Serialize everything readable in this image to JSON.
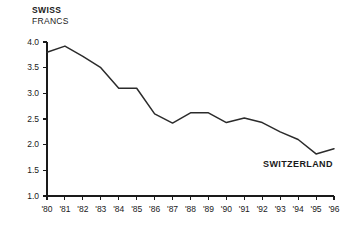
{
  "chart_data": {
    "type": "line",
    "title": "SWISS",
    "subtitle": "FRANCS",
    "series_annotation": "SWITZERLAND",
    "xlabel": "",
    "ylabel": "",
    "grid": false,
    "legend_position": "inline-right",
    "ylim": [
      1.0,
      4.0
    ],
    "ytick_labels": [
      "4.0",
      "3.5",
      "3.0",
      "2.5",
      "2.0",
      "1.5",
      "1.0"
    ],
    "ytick_values": [
      4.0,
      3.5,
      3.0,
      2.5,
      2.0,
      1.5,
      1.0
    ],
    "categories": [
      "'80",
      "'81",
      "'82",
      "'83",
      "'84",
      "'85",
      "'86",
      "'87",
      "'88",
      "'89",
      "'90",
      "'91",
      "'92",
      "'93",
      "'94",
      "'95",
      "'96"
    ],
    "x": [
      1980,
      1981,
      1982,
      1983,
      1984,
      1985,
      1986,
      1987,
      1988,
      1989,
      1990,
      1991,
      1992,
      1993,
      1994,
      1995,
      1996
    ],
    "series": [
      {
        "name": "SWITZERLAND",
        "values": [
          3.8,
          3.92,
          3.72,
          3.5,
          3.1,
          3.1,
          2.6,
          2.42,
          2.62,
          2.62,
          2.43,
          2.52,
          2.43,
          2.25,
          2.1,
          1.82,
          1.92
        ]
      }
    ],
    "colors": {
      "line": "#2b2b2b",
      "axis": "#1a1a1a",
      "text": "#1a1a1a",
      "background": "#ffffff"
    }
  }
}
